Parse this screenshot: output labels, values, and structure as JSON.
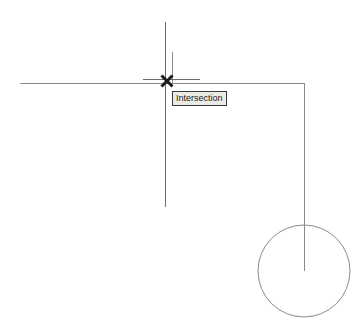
{
  "canvas": {
    "width": 362,
    "height": 332,
    "background_color": "#ffffff",
    "name": "cad-drawing-area"
  },
  "osnap": {
    "tooltip_label": "Intersection",
    "marker_type": "x-marker",
    "marker_color": "#1c1c1c",
    "tooltip_background": "#eceae4",
    "tooltip_border_color": "#3a3a3a",
    "tooltip_text_color": "#1a1a1a",
    "marker_x": 167,
    "marker_y": 81,
    "marker_size": 11
  },
  "crosshair": {
    "color": "#6e6e6e",
    "center_x": 165,
    "center_y": 81,
    "vertical_top": 22,
    "vertical_bottom": 207,
    "horizontal_left": 143,
    "horizontal_right": 200,
    "horizontal_y": 79
  },
  "geometry": {
    "line_color": "#8a8a8a",
    "line_width": 1,
    "entities": [
      {
        "name": "horizontal-construction-line",
        "type": "line",
        "x1": 20,
        "y1": 83,
        "x2": 304,
        "y2": 83
      },
      {
        "name": "vertical-construction-line",
        "type": "line",
        "x1": 172,
        "y1": 52,
        "x2": 172,
        "y2": 83
      },
      {
        "name": "right-vertical-line",
        "type": "line",
        "x1": 304,
        "y1": 83,
        "x2": 304,
        "y2": 271
      },
      {
        "name": "circle-entity",
        "type": "circle",
        "cx": 304,
        "cy": 271,
        "r": 46
      }
    ]
  }
}
